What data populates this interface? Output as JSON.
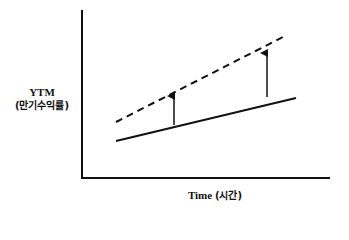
{
  "diagram": {
    "title": "",
    "y_axis": {
      "label_line1": "YTM",
      "label_line2": "(만기수익률)"
    },
    "x_axis": {
      "label_en": "Time",
      "label_kr": "(시간)"
    },
    "colors": {
      "line": "#111111",
      "background": "#ffffff"
    },
    "elements": [
      {
        "type": "solid-line",
        "description": "original yield curve",
        "from": [
          116,
          141
        ],
        "to": [
          296,
          98
        ]
      },
      {
        "type": "dashed-line",
        "description": "shifted yield curve (upward parallel shift)",
        "from": [
          116,
          122
        ],
        "to": [
          287,
          35
        ]
      },
      {
        "type": "arrow-up",
        "x": 174,
        "from_y": 125,
        "to_y": 96
      },
      {
        "type": "arrow-up",
        "x": 267,
        "from_y": 97,
        "to_y": 53
      }
    ]
  }
}
